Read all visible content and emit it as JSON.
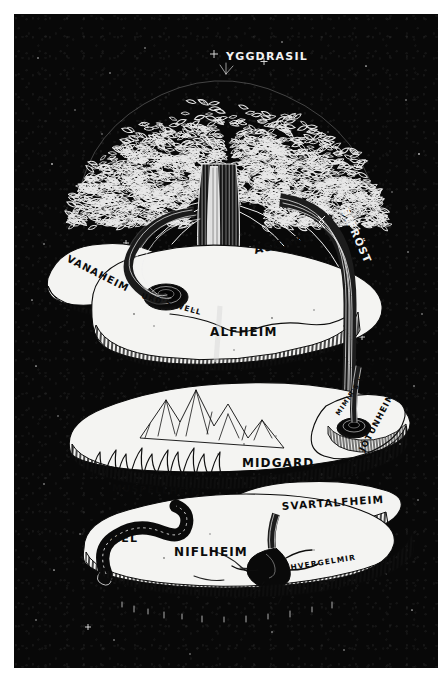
{
  "artwork": {
    "title": "YGGDRASIL",
    "medium": "pen-and-ink illustration",
    "background_color": "#080808",
    "ink_color": "#f2f2f2",
    "paper_color": "#ffffff",
    "land_color": "#f4f4f2",
    "plate": {
      "x": 14,
      "y": 14,
      "width": 424,
      "height": 654
    }
  },
  "labels": {
    "tree": "YGGDRASIL",
    "bridge": "BIFRÖST",
    "upper_realms": [
      "VANAHEIM",
      "ASGARD",
      "ALFHEIM"
    ],
    "upper_well": "URÐ'S WELL",
    "middle_realms": [
      "MUSPELLHEIM",
      "MIDGARD",
      "JÖTUNHEIM",
      "SVARTALFHEIM"
    ],
    "middle_well": "MIMIR'S WELL",
    "lower_realms": [
      "HEL",
      "NIFLHEIM"
    ],
    "lower_well": "HVERGELMIR"
  },
  "tiers": [
    {
      "name": "upper-tier",
      "realms": [
        "VANAHEIM",
        "ASGARD",
        "ALFHEIM"
      ],
      "feature": "URÐ'S WELL",
      "placements": [
        {
          "text": "YGGDRASIL",
          "x": 212,
          "y": 46,
          "rotate": 0,
          "size": 11,
          "tone": "light"
        },
        {
          "text": "BIFRÖST",
          "x": 327,
          "y": 196,
          "rotate": 66,
          "size": 10.5,
          "tone": "light"
        },
        {
          "text": "VANAHEIM",
          "x": 52,
          "y": 247,
          "rotate": 27,
          "size": 10,
          "tone": "dark"
        },
        {
          "text": "ASGARD",
          "x": 241,
          "y": 240,
          "rotate": -13,
          "size": 11.5,
          "tone": "dark"
        },
        {
          "text": "URÐ'S WELL",
          "x": 127,
          "y": 284,
          "rotate": 16,
          "size": 7.5,
          "tone": "dark"
        },
        {
          "text": "ALFHEIM",
          "x": 196,
          "y": 322,
          "rotate": 0,
          "size": 12,
          "tone": "dark"
        }
      ]
    },
    {
      "name": "middle-tier",
      "realms": [
        "MUSPELLHEIM",
        "MIDGARD",
        "JÖTUNHEIM",
        "SVARTALFHEIM"
      ],
      "feature": "MIMIR'S WELL",
      "placements": [
        {
          "text": "MIMIR'S WELL",
          "x": 325,
          "y": 402,
          "rotate": -56,
          "size": 6.5,
          "tone": "dark"
        },
        {
          "text": "JÖTUNHEIM",
          "x": 350,
          "y": 438,
          "rotate": -62,
          "size": 8.5,
          "tone": "dark"
        },
        {
          "text": "MIDGARD",
          "x": 228,
          "y": 453,
          "rotate": 0,
          "size": 12,
          "tone": "dark"
        },
        {
          "text": "MUSPELLHEIM",
          "x": 98,
          "y": 477,
          "rotate": 3,
          "size": 9.5,
          "tone": "dark"
        },
        {
          "text": "SVARTALFHEIM",
          "x": 268,
          "y": 496,
          "rotate": -4,
          "size": 10.5,
          "tone": "dark"
        }
      ]
    },
    {
      "name": "lower-tier",
      "realms": [
        "HEL",
        "NIFLHEIM"
      ],
      "feature": "HVERGELMIR",
      "placements": [
        {
          "text": "HEL",
          "x": 97,
          "y": 528,
          "rotate": 0,
          "size": 11,
          "tone": "dark"
        },
        {
          "text": "NIFLHEIM",
          "x": 160,
          "y": 542,
          "rotate": 0,
          "size": 12,
          "tone": "dark"
        },
        {
          "text": "HVERGELMIR",
          "x": 277,
          "y": 556,
          "rotate": -9,
          "size": 7.5,
          "tone": "dark"
        }
      ]
    }
  ],
  "elements": {
    "canopy": "dense leaf-clustered crown",
    "trunk": "vertical striated trunk",
    "roots": "three great roots descending to the three wells",
    "serpent": "coiled serpent beside Hel",
    "mountains": "jagged mountain range on Midgard",
    "flames": "flame field on Muspellheim",
    "stars": "scattered star field"
  }
}
